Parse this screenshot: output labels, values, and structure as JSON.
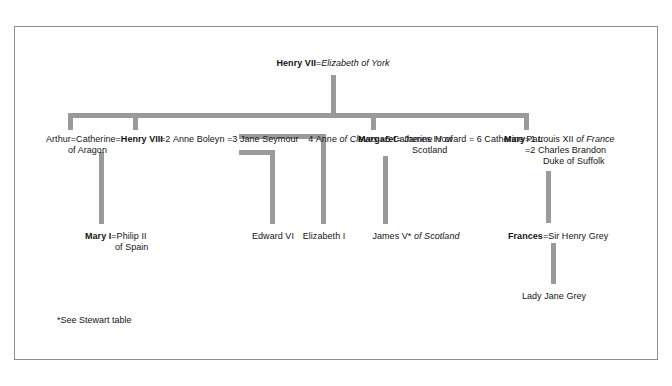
{
  "diagram": {
    "title_note": "Tudor family tree",
    "footnote": "*See Stewart table",
    "colors": {
      "line": "#9a9a9a",
      "border": "#8f8f8f",
      "text": "#141414",
      "background": "#ffffff"
    }
  },
  "nodes": {
    "henry7": {
      "name": "Henry VII",
      "equals": "=",
      "spouse": "Elizabeth of York"
    },
    "arthur": {
      "name": "Arthur",
      "equals": "=",
      "spouse_line1": "Catherine",
      "spouse_line2": "of Aragon"
    },
    "henry8": {
      "name": "Henry VIII",
      "equals_before": "=",
      "wives": [
        {
          "marker": "=",
          "number": "2",
          "label": "Anne Boleyn",
          "italic": ""
        },
        {
          "marker": "=",
          "number": "3",
          "label": "Jane Seymour",
          "italic": ""
        },
        {
          "marker": "",
          "number": "4",
          "label": "Anne ",
          "italic": "of Cleves"
        },
        {
          "marker": "=",
          "number": "5",
          "label": "Catherine Howard",
          "italic": ""
        },
        {
          "marker": "=",
          "number": "6",
          "label": "Catherine Parr",
          "italic": ""
        }
      ]
    },
    "margaret": {
      "name": "Margaret",
      "equals": "=",
      "spouse_line1_plain": "James IV ",
      "spouse_line1_italic": "of",
      "spouse_line2_italic": "Scotland"
    },
    "mary_tudor": {
      "name": "Mary",
      "equals": "=",
      "husband1_number": "1",
      "husband1_plain": "Louis XII ",
      "husband1_italic": "of France",
      "husband2_marker": "=",
      "husband2_number": "2",
      "husband2_plain": "Charles Brandon",
      "husband2_title_italic": "Duke of Suffolk"
    },
    "mary1": {
      "name": "Mary I",
      "equals": "=",
      "spouse_line1": "Philip II",
      "spouse_line2_italic": "of Spain"
    },
    "edward6": {
      "name": "Edward VI"
    },
    "elizabeth1": {
      "name": "Elizabeth I"
    },
    "james5": {
      "name": "James V*",
      "plain_suffix": " ",
      "italic_suffix": "of Scotland"
    },
    "frances": {
      "name": "Frances",
      "equals": "=",
      "spouse": "Sir Henry Grey"
    },
    "lady_jane_grey": {
      "name": "Lady Jane Grey"
    }
  }
}
